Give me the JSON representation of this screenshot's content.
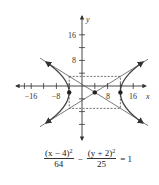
{
  "axes": {
    "x_label": "x",
    "y_label": "y",
    "x_ticks": [
      {
        "value": -16,
        "label": "−16"
      },
      {
        "value": -8,
        "label": "−8"
      },
      {
        "value": 8,
        "label": "8"
      },
      {
        "value": 16,
        "label": "16"
      }
    ],
    "y_ticks": [
      {
        "value": 16,
        "label": "16"
      },
      {
        "value": 8,
        "label": "8"
      }
    ]
  },
  "hyperbola": {
    "center": [
      4,
      -2
    ],
    "a": 8,
    "b": 5,
    "vertices": [
      [
        -4,
        -2
      ],
      [
        12,
        -2
      ]
    ]
  },
  "equation": {
    "term1_num": "(x − 4)",
    "term1_exp": "2",
    "term1_den": "64",
    "minus": "−",
    "term2_num": "(y + 2)",
    "term2_exp": "2",
    "term2_den": "25",
    "rhs": "= 1"
  },
  "colors": {
    "stroke": "#333333",
    "curve": "#444444",
    "background": "#ffffff"
  }
}
